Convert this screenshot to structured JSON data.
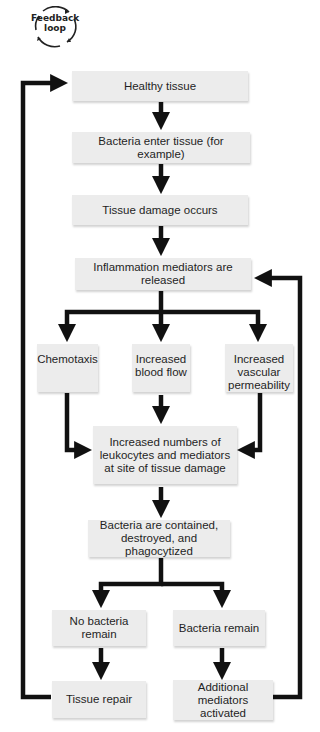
{
  "legend": {
    "icon": "feedback-loop-cycle-icon",
    "label": "Feedback\nloop"
  },
  "nodes": {
    "healthy_tissue": "Healthy tissue",
    "bacteria_enter": "Bacteria enter tissue (for example)",
    "tissue_damage": "Tissue damage occurs",
    "mediators_released": "Inflammation mediators are released",
    "chemotaxis": "Chemotaxis",
    "blood_flow": "Increased\nblood flow",
    "vascular_permeability": "Increased\nvascular\npermeability",
    "increased_leukocytes": "Increased numbers of\nleukocytes and mediators\nat site of tissue damage",
    "bacteria_contained": "Bacteria are contained,\ndestroyed, and phagocytized",
    "no_bacteria_remain": "No bacteria remain",
    "bacteria_remain": "Bacteria remain",
    "tissue_repair": "Tissue repair",
    "additional_mediators": "Additional mediators\nactivated"
  },
  "colors": {
    "box_fill": "#ececec",
    "arrow": "#111111",
    "text": "#1f1f1f"
  },
  "edges": [
    [
      "healthy_tissue",
      "bacteria_enter"
    ],
    [
      "bacteria_enter",
      "tissue_damage"
    ],
    [
      "tissue_damage",
      "mediators_released"
    ],
    [
      "mediators_released",
      "chemotaxis"
    ],
    [
      "mediators_released",
      "blood_flow"
    ],
    [
      "mediators_released",
      "vascular_permeability"
    ],
    [
      "chemotaxis",
      "increased_leukocytes"
    ],
    [
      "blood_flow",
      "increased_leukocytes"
    ],
    [
      "vascular_permeability",
      "increased_leukocytes"
    ],
    [
      "increased_leukocytes",
      "bacteria_contained"
    ],
    [
      "bacteria_contained",
      "no_bacteria_remain"
    ],
    [
      "bacteria_contained",
      "bacteria_remain"
    ],
    [
      "no_bacteria_remain",
      "tissue_repair"
    ],
    [
      "bacteria_remain",
      "additional_mediators"
    ],
    [
      "tissue_repair",
      "healthy_tissue"
    ],
    [
      "additional_mediators",
      "mediators_released"
    ]
  ]
}
